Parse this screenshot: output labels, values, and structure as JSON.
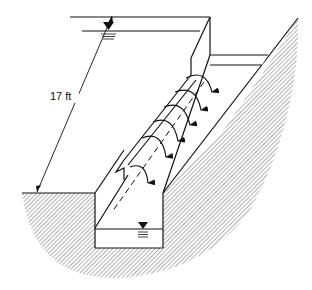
{
  "figure": {
    "dimension_label": "17 ft",
    "colors": {
      "line": "#111111",
      "hatch": "#555555",
      "background": "#ffffff"
    },
    "symbols": {
      "upstream_water_level": "water-surface-triangle-icon",
      "downstream_water_level": "water-surface-triangle-icon"
    },
    "flow_arrows_count": 6
  }
}
